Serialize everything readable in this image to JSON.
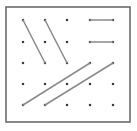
{
  "figure": {
    "name": "geoboard-parallel-segments",
    "width": 137,
    "height": 131,
    "background_color": "#ffffff"
  },
  "frame": {
    "x": 6,
    "y": 7,
    "width": 124,
    "height": 115,
    "stroke_color": "#6b6b6b",
    "stroke_width": 1.6,
    "fill_color": "#ffffff"
  },
  "grid": {
    "rows": 5,
    "cols": 5,
    "x_positions": [
      23,
      45,
      67,
      90,
      113
    ],
    "y_positions": [
      20,
      42,
      63,
      84,
      105
    ],
    "dot_color": "#3a3a3a",
    "dot_size": 2.2
  },
  "segments": [
    {
      "label": "steep-diagonal-left",
      "x1": 23,
      "y1": 20,
      "x2": 45,
      "y2": 63,
      "color": "#8a8a8a",
      "width": 1.5
    },
    {
      "label": "steep-diagonal-right",
      "x1": 45,
      "y1": 20,
      "x2": 67,
      "y2": 63,
      "color": "#8a8a8a",
      "width": 1.5
    },
    {
      "label": "horizontal-top",
      "x1": 90,
      "y1": 20,
      "x2": 113,
      "y2": 20,
      "color": "#8a8a8a",
      "width": 1.5
    },
    {
      "label": "horizontal-second",
      "x1": 90,
      "y1": 42,
      "x2": 113,
      "y2": 42,
      "color": "#8a8a8a",
      "width": 1.5
    },
    {
      "label": "shallow-diagonal-lower-left",
      "x1": 23,
      "y1": 105,
      "x2": 90,
      "y2": 63,
      "color": "#8a8a8a",
      "width": 1.5
    },
    {
      "label": "shallow-diagonal-lower-right",
      "x1": 45,
      "y1": 105,
      "x2": 113,
      "y2": 63,
      "color": "#8a8a8a",
      "width": 1.5
    }
  ]
}
